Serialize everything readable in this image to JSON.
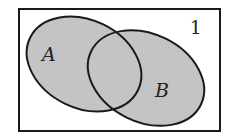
{
  "diagram": {
    "type": "venn",
    "universe_label": "1",
    "sets": [
      {
        "id": "A",
        "label": "A",
        "shaded": true
      },
      {
        "id": "B",
        "label": "B",
        "shaded": true
      }
    ],
    "intersection_shaded": true,
    "colors": {
      "fill": "#c4c4c4",
      "stroke": "#1a1a1a",
      "background": "#ffffff",
      "text": "#222222"
    }
  }
}
